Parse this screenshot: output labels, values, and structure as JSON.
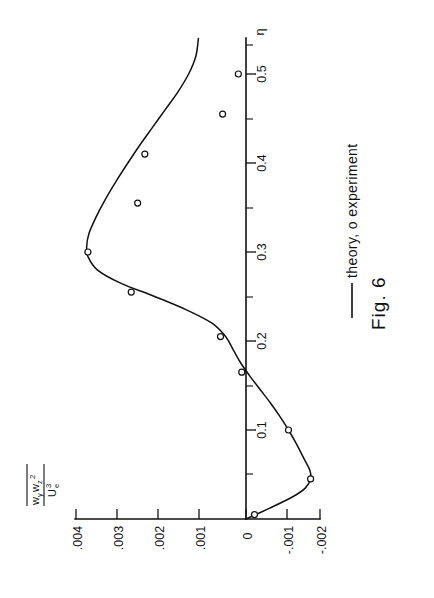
{
  "figure": {
    "caption": "Fig. 6",
    "legend": {
      "line_symbol": "solid-line",
      "text": "theory, o experiment",
      "theory_label": "theory",
      "experiment_label": "experiment",
      "experiment_marker": "o"
    },
    "orientation_note": "rotated-90",
    "ink_color": "#111111",
    "background_color": "#ffffff"
  },
  "axes": {
    "x": {
      "label": "η",
      "label_name": "eta",
      "major_ticks": [
        "0.1",
        "0.2",
        "0.3",
        "0.4",
        "0.5"
      ],
      "major_values": [
        0.1,
        0.2,
        0.3,
        0.4,
        0.5
      ],
      "minor_values": [
        0.05,
        0.15,
        0.25,
        0.35,
        0.45,
        0.55
      ],
      "range": [
        0,
        0.56
      ]
    },
    "y": {
      "label_numerator": "wywz2",
      "label_denominator": "Ue3",
      "numerator_main": "w",
      "numerator_sub_1": "y",
      "numerator_main_2": "w",
      "numerator_sub_2": "z",
      "numerator_sup_2": "2",
      "denominator_main": "U",
      "denominator_sub": "e",
      "denominator_sup": "3",
      "ticks": [
        ".004",
        ".003",
        ".002",
        ".001",
        "0",
        "-.001",
        "-.002"
      ],
      "tick_values": [
        0.004,
        0.003,
        0.002,
        0.001,
        0,
        -0.001,
        -0.002
      ],
      "range": [
        -0.002,
        0.004
      ]
    }
  },
  "chart_data": {
    "type": "line",
    "title": "Fig. 6",
    "xlabel": "η",
    "ylabel": "wy wz^2 / Ue^3",
    "xlim": [
      0,
      0.56
    ],
    "ylim": [
      -0.002,
      0.004
    ],
    "grid": false,
    "legend_position": "right",
    "orientation": "rotated-90-ccw",
    "series": [
      {
        "name": "theory",
        "style": "solid-line",
        "x": [
          0.0,
          0.012,
          0.025,
          0.035,
          0.045,
          0.055,
          0.07,
          0.085,
          0.1,
          0.115,
          0.13,
          0.145,
          0.16,
          0.175,
          0.19,
          0.205,
          0.22,
          0.235,
          0.25,
          0.265,
          0.28,
          0.295,
          0.305,
          0.32,
          0.34,
          0.36,
          0.38,
          0.4,
          0.42,
          0.44,
          0.46,
          0.48,
          0.5,
          0.52,
          0.54
        ],
        "y": [
          0.0,
          -0.00055,
          -0.0011,
          -0.0014,
          -0.00152,
          -0.0015,
          -0.00134,
          -0.00118,
          -0.001,
          -0.0008,
          -0.00058,
          -0.00034,
          -0.0001,
          0.00012,
          0.0003,
          0.00048,
          0.0008,
          0.0014,
          0.00215,
          0.00295,
          0.0035,
          0.00372,
          0.00375,
          0.0037,
          0.00352,
          0.0033,
          0.00305,
          0.00278,
          0.0025,
          0.0022,
          0.0019,
          0.0016,
          0.00135,
          0.00118,
          0.00112
        ]
      },
      {
        "name": "experiment",
        "style": "open-circle",
        "x": [
          0.005,
          0.045,
          0.1,
          0.165,
          0.205,
          0.255,
          0.3,
          0.355,
          0.41,
          0.455,
          0.5
        ],
        "y": [
          -0.0002,
          -0.00152,
          -0.001,
          0.0001,
          0.0006,
          0.0027,
          0.00372,
          0.00255,
          0.00238,
          0.00055,
          0.00018
        ]
      }
    ]
  }
}
